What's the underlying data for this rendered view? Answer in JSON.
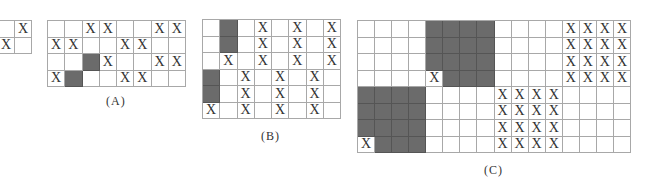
{
  "figure": {
    "legend": {
      "X": "marked cell",
      "G": "shaded cell",
      "_": "empty cell"
    },
    "partial_grid": {
      "rows": [
        [
          "_",
          "X"
        ],
        [
          "X",
          "_"
        ]
      ]
    },
    "panels": [
      {
        "label": "(A)",
        "cols": 8,
        "rows": [
          [
            "_",
            "_",
            "X",
            "X",
            "_",
            "_",
            "X",
            "X"
          ],
          [
            "X",
            "X",
            "_",
            "_",
            "X",
            "X",
            "_",
            "_"
          ],
          [
            "_",
            "_",
            "G",
            "X",
            "_",
            "_",
            "X",
            "X"
          ],
          [
            "X",
            "G",
            "_",
            "_",
            "X",
            "X",
            "_",
            "_"
          ]
        ]
      },
      {
        "label": "(B)",
        "cols": 8,
        "rows": [
          [
            "_",
            "G",
            "_",
            "X",
            "_",
            "X",
            "_",
            "X"
          ],
          [
            "_",
            "G",
            "_",
            "X",
            "_",
            "X",
            "_",
            "X"
          ],
          [
            "_",
            "X",
            "_",
            "X",
            "_",
            "X",
            "_",
            "X"
          ],
          [
            "G",
            "_",
            "X",
            "_",
            "X",
            "_",
            "X",
            "_"
          ],
          [
            "G",
            "_",
            "X",
            "_",
            "X",
            "_",
            "X",
            "_"
          ],
          [
            "X",
            "_",
            "X",
            "_",
            "X",
            "_",
            "X",
            "_"
          ]
        ]
      },
      {
        "label": "(C)",
        "cols": 16,
        "rows": [
          [
            "_",
            "_",
            "_",
            "_",
            "G",
            "G",
            "G",
            "G",
            "_",
            "_",
            "_",
            "_",
            "X",
            "X",
            "X",
            "X"
          ],
          [
            "_",
            "_",
            "_",
            "_",
            "G",
            "G",
            "G",
            "G",
            "_",
            "_",
            "_",
            "_",
            "X",
            "X",
            "X",
            "X"
          ],
          [
            "_",
            "_",
            "_",
            "_",
            "G",
            "G",
            "G",
            "G",
            "_",
            "_",
            "_",
            "_",
            "X",
            "X",
            "X",
            "X"
          ],
          [
            "_",
            "_",
            "_",
            "_",
            "X",
            "G",
            "G",
            "G",
            "_",
            "_",
            "_",
            "_",
            "X",
            "X",
            "X",
            "X"
          ],
          [
            "G",
            "G",
            "G",
            "G",
            "_",
            "_",
            "_",
            "_",
            "X",
            "X",
            "X",
            "X",
            "_",
            "_",
            "_",
            "_"
          ],
          [
            "G",
            "G",
            "G",
            "G",
            "_",
            "_",
            "_",
            "_",
            "X",
            "X",
            "X",
            "X",
            "_",
            "_",
            "_",
            "_"
          ],
          [
            "G",
            "G",
            "G",
            "G",
            "_",
            "_",
            "_",
            "_",
            "X",
            "X",
            "X",
            "X",
            "_",
            "_",
            "_",
            "_"
          ],
          [
            "X",
            "G",
            "G",
            "G",
            "_",
            "_",
            "_",
            "_",
            "X",
            "X",
            "X",
            "X",
            "_",
            "_",
            "_",
            "_"
          ]
        ]
      }
    ],
    "colors": {
      "shaded": "#6b6b6b",
      "grid_line": "#a8a8a8",
      "mark": "#333333"
    }
  }
}
